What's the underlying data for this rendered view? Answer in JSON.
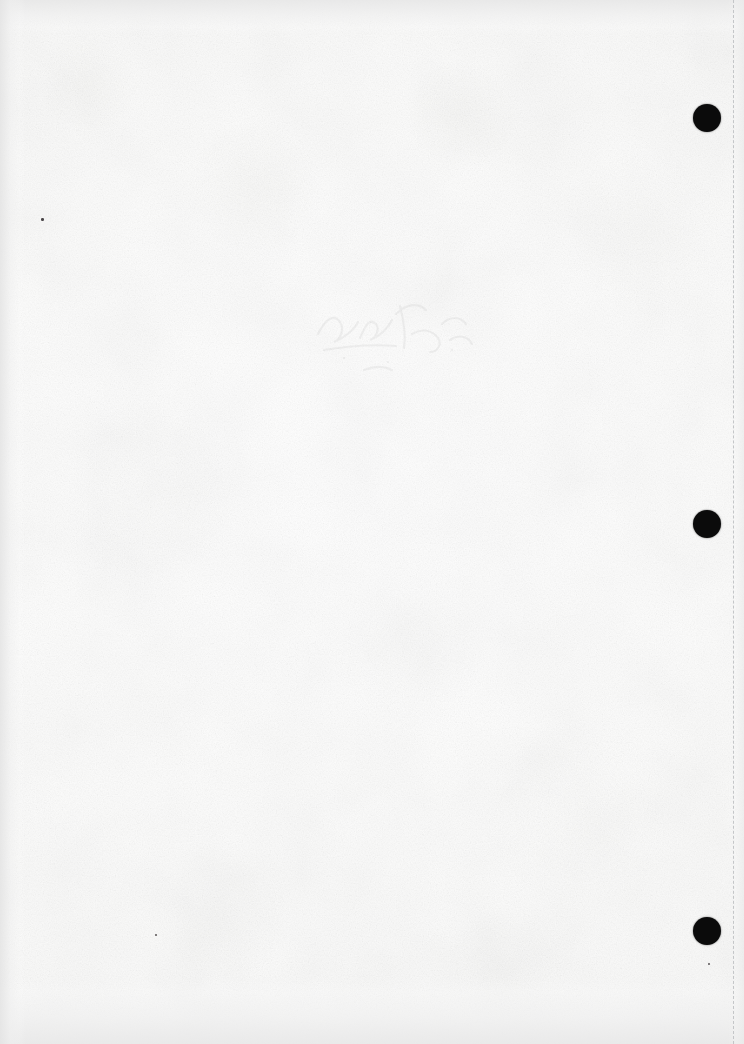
{
  "document": {
    "kind": "scanned-page",
    "page_label": "",
    "visible_text": "",
    "description": "Blank scanned page, no printed or legible text visible",
    "width_px": 744,
    "height_px": 1044,
    "paper_color": "#fdfdfd",
    "ink_color": "#0b0b0b"
  },
  "marks": {
    "punch_holes": [
      {
        "name": "punch-hole-top",
        "cx": 707,
        "cy": 118,
        "diameter": 28,
        "color": "#0b0b0b"
      },
      {
        "name": "punch-hole-middle",
        "cx": 707,
        "cy": 524,
        "diameter": 28,
        "color": "#0b0b0b"
      },
      {
        "name": "punch-hole-bottom",
        "cx": 707,
        "cy": 931,
        "diameter": 28,
        "color": "#0b0b0b"
      }
    ],
    "guide_line": {
      "name": "right-margin-dashed-line",
      "x": 733,
      "style": "dashed",
      "color": "#c4c6c8",
      "thickness": 1.5,
      "from_y": 0,
      "to_y": 1044
    },
    "specks": [
      {
        "name": "speck-upper-left",
        "x": 41,
        "y": 218,
        "size": 2.5,
        "color": "#4a4648"
      },
      {
        "name": "speck-lower-left",
        "x": 155,
        "y": 934,
        "size": 2.0,
        "color": "#575354"
      },
      {
        "name": "speck-lower-right",
        "x": 708,
        "y": 963,
        "size": 1.8,
        "color": "#5d595a"
      }
    ],
    "bleed_through": {
      "name": "handwriting-bleed-through",
      "x": 300,
      "y": 288,
      "width": 190,
      "height": 100,
      "opacity": 0.055,
      "note": "Faint ink bleed-through from reverse side, illegible"
    }
  },
  "scan_artifacts": {
    "top_band_color": "#e8e8e8",
    "bottom_band_color": "#e9e9e9",
    "left_edge_color": "#e4e4e4",
    "right_edge_color": "#eaeaea",
    "vignette": true,
    "texture": "paper-fibre-speckle"
  }
}
